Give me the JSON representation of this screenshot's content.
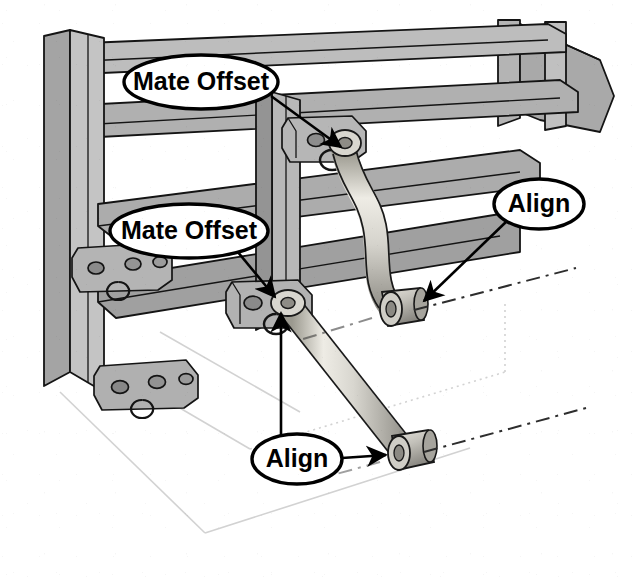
{
  "document": {
    "kind": "scanned-cad-assembly-illustration",
    "subject": "Suspension control arm linkage mounted to a structural frame",
    "width": 638,
    "height": 586,
    "background_color": "#ffffff"
  },
  "palette": {
    "outline": "#111111",
    "frame_face_light": "#c9c9c9",
    "frame_face_mid": "#a8a8a8",
    "frame_face_dark": "#8c8c8c",
    "bracket_light": "#bdbdbd",
    "bracket_mid": "#9e9e9e",
    "bracket_dark": "#7d7d7d",
    "arm_light": "#e2e0da",
    "arm_mid": "#c3c1ba",
    "arm_dark": "#97958e",
    "bushing_light": "#d5d3cc",
    "bushing_dark": "#8f8d86",
    "construction_line": "#d0d0d0",
    "centerline": "#2b2b2b",
    "callout_fill": "#ffffff",
    "callout_stroke": "#000000",
    "callout_text": "#000000"
  },
  "callouts": [
    {
      "id": "mate-offset-upper",
      "label": "Mate Offset",
      "shape": "ellipse",
      "cx": 201,
      "cy": 82,
      "rx": 77,
      "ry": 27,
      "font_size": 25,
      "target_x": 337,
      "target_y": 155,
      "leader": "M 271 96 L 346 141",
      "arrow_angle_deg": 31
    },
    {
      "id": "mate-offset-lower",
      "label": "Mate Offset",
      "shape": "ellipse",
      "cx": 189,
      "cy": 231,
      "rx": 79,
      "ry": 27,
      "font_size": 25,
      "target_x": 271,
      "target_y": 302,
      "leader": "M 237 251 L 279 297",
      "arrow_angle_deg": 48
    },
    {
      "id": "align-upper",
      "label": "Align",
      "shape": "ellipse",
      "cx": 539,
      "cy": 204,
      "rx": 45,
      "ry": 25,
      "font_size": 25,
      "target_x": 418,
      "target_y": 307,
      "leader": "M 508 220 L 424 301",
      "arrow_angle_deg": 136
    },
    {
      "id": "align-lower",
      "label": "Align",
      "shape": "ellipse",
      "cx": 297,
      "cy": 459,
      "rx": 45,
      "ry": 25,
      "font_size": 25,
      "target_x": 393,
      "target_y": 455,
      "leader": "M 342 458 L 387 456",
      "arrow_angle_deg": 2
    }
  ],
  "pivot_stem": {
    "id": "align-lower-pivot-stem",
    "path": "M 281 451 L 281 313",
    "arrow_x": 281,
    "arrow_y": 306,
    "arrow_angle_deg": -90
  },
  "frame": {
    "description": "Welded rectangular tube frame drawn in isometric projection",
    "members": [
      {
        "id": "post-left-front",
        "type": "vertical-post"
      },
      {
        "id": "post-left-rear",
        "type": "vertical-post"
      },
      {
        "id": "post-right-front",
        "type": "vertical-post"
      },
      {
        "id": "post-right-rear",
        "type": "vertical-post"
      },
      {
        "id": "rail-upper-diagonal",
        "type": "horizontal-rail"
      },
      {
        "id": "rail-middle-diagonal",
        "type": "horizontal-rail"
      },
      {
        "id": "rail-lower-diagonal",
        "type": "horizontal-rail"
      },
      {
        "id": "rail-top-cross",
        "type": "horizontal-rail"
      }
    ]
  },
  "brackets": [
    {
      "id": "bracket-upper-right",
      "holes": 2,
      "note": "upper arm pivot mount"
    },
    {
      "id": "bracket-lower-right",
      "holes": 2,
      "note": "lower arm pivot mount"
    },
    {
      "id": "bracket-upper-left",
      "holes": 3,
      "note": "mirrored mount on left post"
    },
    {
      "id": "bracket-lower-left",
      "holes": 3,
      "note": "mirrored mount on left post"
    }
  ],
  "linkage": [
    {
      "id": "upper-control-arm",
      "shape": "s-curved-tube",
      "inboard_joint": "bracket-upper-right",
      "outboard_bushing": "bushing-upper-outboard"
    },
    {
      "id": "lower-control-arm",
      "shape": "straight-tube",
      "inboard_joint": "bracket-lower-right",
      "outboard_bushing": "bushing-lower-outboard"
    }
  ],
  "centerlines": [
    {
      "id": "centerline-upper-bushing",
      "style": "dash-dot"
    },
    {
      "id": "centerline-lower-bushing",
      "style": "dash-dot"
    }
  ],
  "construction_lines": [
    {
      "id": "ground-plane-left",
      "style": "light-solid"
    },
    {
      "id": "ground-plane-bottom",
      "style": "light-solid"
    },
    {
      "id": "ground-plane-right",
      "style": "light-dotted"
    }
  ]
}
